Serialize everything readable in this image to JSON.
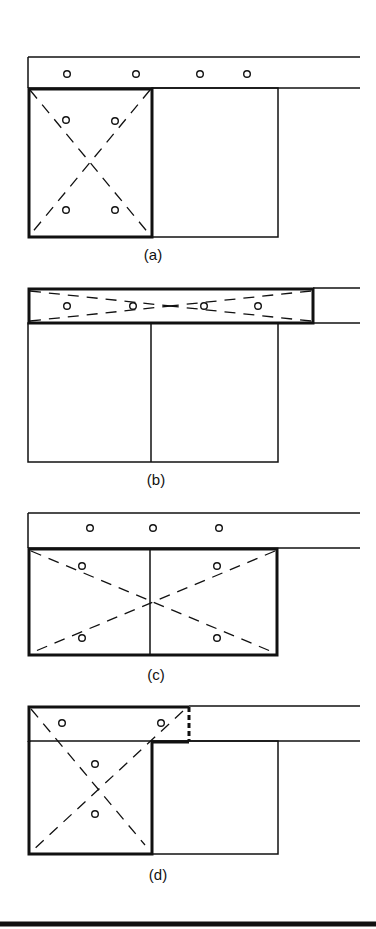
{
  "figure": {
    "panels": [
      {
        "id": "a",
        "label": "(a)"
      },
      {
        "id": "b",
        "label": "(b)"
      },
      {
        "id": "c",
        "label": "(c)"
      },
      {
        "id": "d",
        "label": "(d)"
      }
    ]
  },
  "colors": {
    "ink": "#111111",
    "background": "#ffffff"
  }
}
